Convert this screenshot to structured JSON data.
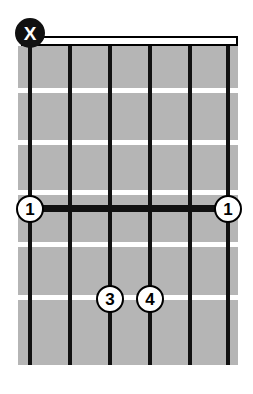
{
  "diagram": {
    "type": "guitar-chord-diagram",
    "orientation": "vertical",
    "string_count": 6,
    "fret_count": 6,
    "starting_fret": 1,
    "colors": {
      "background": "#ffffff",
      "fretboard": "#b5b5b5",
      "string": "#111111",
      "fret_line": "#ffffff",
      "nut_fill": "#ffffff",
      "nut_border": "#000000",
      "marker_fill": "#ffffff",
      "marker_border": "#000000",
      "marker_text": "#000000",
      "muted_fill": "#111111",
      "muted_text": "#ffffff",
      "barre": "#111111"
    },
    "nut": {
      "visible": true,
      "style": "open-outline"
    },
    "strings": [
      {
        "index": 1,
        "x": 30
      },
      {
        "index": 2,
        "x": 70
      },
      {
        "index": 3,
        "x": 110
      },
      {
        "index": 4,
        "x": 150
      },
      {
        "index": 5,
        "x": 190
      },
      {
        "index": 6,
        "x": 228
      }
    ],
    "frets": [
      {
        "index": 1,
        "y": 88
      },
      {
        "index": 2,
        "y": 140
      },
      {
        "index": 3,
        "y": 190
      },
      {
        "index": 4,
        "y": 242
      },
      {
        "index": 5,
        "y": 295
      }
    ],
    "open_mute_markers": [
      {
        "string": 1,
        "symbol": "X",
        "meaning": "muted",
        "x": 30,
        "y": 33
      }
    ],
    "barres": [
      {
        "finger": "1",
        "fret": 4,
        "from_string": 1,
        "to_string": 6,
        "y": 209,
        "x_start": 30,
        "x_end": 228,
        "end_labels": [
          "1",
          "1"
        ]
      }
    ],
    "finger_markers": [
      {
        "label": "1",
        "string": 1,
        "fret": 4,
        "x": 30,
        "y": 209
      },
      {
        "label": "1",
        "string": 6,
        "fret": 4,
        "x": 228,
        "y": 209
      },
      {
        "label": "3",
        "string": 3,
        "fret": 6,
        "x": 110,
        "y": 299
      },
      {
        "label": "4",
        "string": 4,
        "fret": 6,
        "x": 150,
        "y": 299
      }
    ]
  }
}
